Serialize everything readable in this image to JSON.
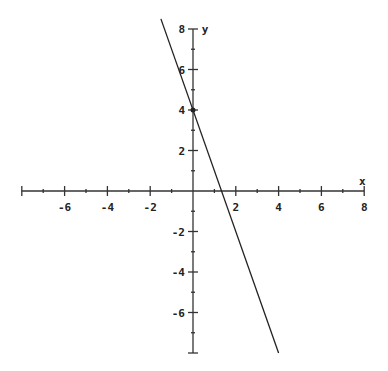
{
  "chart_data": {
    "type": "line",
    "title": "",
    "xlabel": "x",
    "ylabel": "y",
    "xlim": [
      -8,
      8
    ],
    "ylim": [
      -8,
      8
    ],
    "grid": false,
    "x_tick_labels": [
      "-6",
      "-4",
      "-2",
      "2",
      "4",
      "6",
      "8"
    ],
    "x_ticks": [
      -6,
      -4,
      -2,
      2,
      4,
      6,
      8
    ],
    "y_tick_labels": [
      "8",
      "6",
      "4",
      "2",
      "-2",
      "-4",
      "-6"
    ],
    "y_ticks": [
      8,
      6,
      4,
      2,
      -2,
      -4,
      -6
    ],
    "series": [
      {
        "name": "y = -3x + 4",
        "x": [
          -1.5,
          4
        ],
        "y": [
          8.5,
          -8
        ],
        "slope": -3,
        "intercept": 4
      }
    ],
    "annotations": [
      {
        "type": "point",
        "x": 0,
        "y": 4
      }
    ],
    "line_color": "#222222"
  },
  "axes": {
    "x_label": "x",
    "y_label": "y"
  }
}
